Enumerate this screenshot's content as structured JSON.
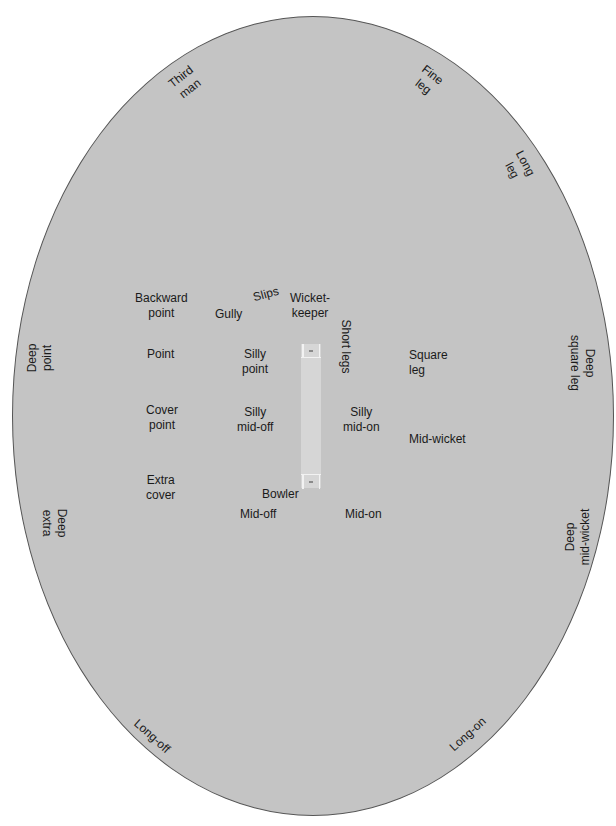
{
  "diagram": {
    "colors": {
      "field_fill": "#c4c4c4",
      "field_border": "#555555",
      "pitch_fill": "#d6d6d6",
      "crease_lines": "#f2f2f2",
      "text": "#1a1a1a"
    },
    "positions": {
      "third_man": "Third\nman",
      "fine_leg": "Fine\nleg",
      "long_leg": "Long\nleg",
      "backward_point": "Backward\npoint",
      "gully": "Gully",
      "slips": "Slips",
      "wicket_keeper": "Wicket-\nkeeper",
      "short_legs": "Short legs",
      "deep_point": "Deep\npoint",
      "point": "Point",
      "silly_point": "Silly\npoint",
      "square_leg": "Square\nleg",
      "deep_square_leg": "Deep\nsquare leg",
      "cover_point": "Cover\npoint",
      "silly_mid_off": "Silly\nmid-off",
      "silly_mid_on": "Silly\nmid-on",
      "mid_wicket": "Mid-wicket",
      "extra_cover": "Extra\ncover",
      "bowler": "Bowler",
      "mid_off": "Mid-off",
      "mid_on": "Mid-on",
      "deep_extra": "Deep\nextra",
      "deep_mid_wicket": "Deep\nmid-wicket",
      "long_off": "Long-off",
      "long_on": "Long-on"
    }
  }
}
